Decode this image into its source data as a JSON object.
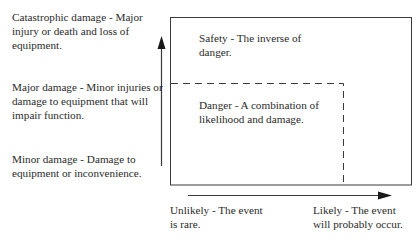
{
  "y_axis": {
    "direction": "increasing severity of damage",
    "labels": [
      {
        "text": "Catastrophic damage - Major\ninjury or death and loss of\nequipment."
      },
      {
        "text": "Major damage - Minor injuries or\ndamage to equipment that will\nimpair function."
      },
      {
        "text": "Minor damage - Damage to\nequipment or inconvenience."
      }
    ]
  },
  "x_axis": {
    "direction": "increasing likelihood",
    "labels": [
      {
        "text": "Unlikely - The event\nis rare."
      },
      {
        "text": "Likely - The event\nwill probably occur."
      }
    ]
  },
  "regions": {
    "safety": "Safety - The inverse of\ndanger.",
    "danger": "Danger - A combination of\nlikelihood and damage."
  },
  "colors": {
    "line": "#3a3a3a",
    "text": "#2a2a2a",
    "background": "#ffffff"
  }
}
